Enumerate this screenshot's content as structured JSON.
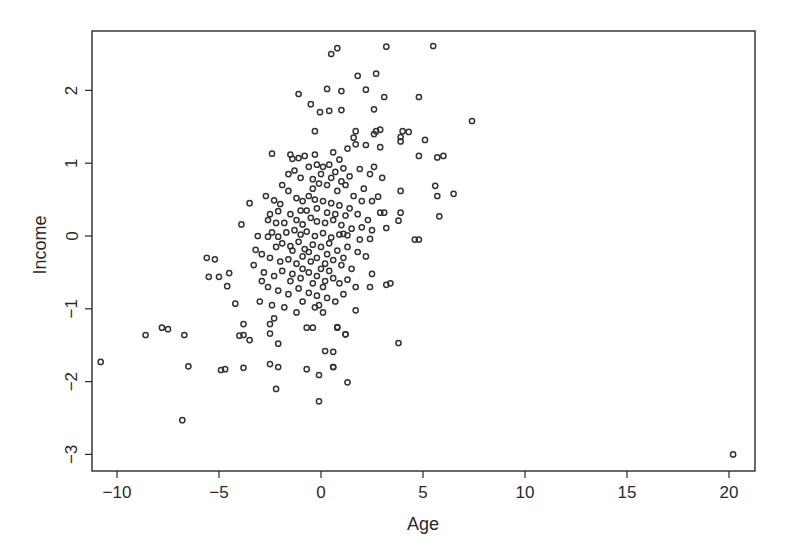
{
  "chart_data": {
    "type": "scatter",
    "title": "",
    "xlabel": "Age",
    "ylabel": "Income",
    "xlim": [
      -11.3,
      21.3
    ],
    "ylim": [
      -3.2,
      2.8
    ],
    "xticks": [
      -10,
      -5,
      0,
      5,
      10,
      15,
      20
    ],
    "yticks": [
      -3,
      -2,
      -1,
      0,
      1,
      2
    ],
    "xtick_labels": [
      "−10",
      "−5",
      "0",
      "5",
      "10",
      "15",
      "20"
    ],
    "ytick_labels": [
      "−3",
      "−2",
      "−1",
      "0",
      "1",
      "2"
    ],
    "grid": false,
    "legend": null,
    "marker": "open-circle",
    "marker_color": "#333333",
    "points": [
      [
        -10.8,
        -1.73
      ],
      [
        -8.6,
        -1.36
      ],
      [
        -7.8,
        -1.26
      ],
      [
        -7.5,
        -1.28
      ],
      [
        -6.7,
        -1.36
      ],
      [
        -6.5,
        -1.79
      ],
      [
        -6.8,
        -2.53
      ],
      [
        -5.6,
        -0.3
      ],
      [
        -5.2,
        -0.32
      ],
      [
        -5.5,
        -0.56
      ],
      [
        -5.0,
        -0.56
      ],
      [
        -4.5,
        -0.51
      ],
      [
        -4.6,
        -0.69
      ],
      [
        -4.2,
        -0.93
      ],
      [
        -4.0,
        -1.37
      ],
      [
        -4.9,
        -1.84
      ],
      [
        -4.7,
        -1.83
      ],
      [
        -3.8,
        -1.81
      ],
      [
        -3.2,
        -0.19
      ],
      [
        -3.5,
        -1.43
      ],
      [
        -3.9,
        0.16
      ],
      [
        -3.5,
        0.45
      ],
      [
        -2.4,
        1.13
      ],
      [
        -2.7,
        0.55
      ],
      [
        -2.3,
        0.49
      ],
      [
        -2.5,
        0.3
      ],
      [
        -2.1,
        0.34
      ],
      [
        -2.4,
        0.05
      ],
      [
        -2.6,
        -0.01
      ],
      [
        -2.1,
        -0.01
      ],
      [
        -3.8,
        -1.21
      ],
      [
        -3.8,
        -1.36
      ],
      [
        -2.5,
        -1.21
      ],
      [
        -2.3,
        -1.13
      ],
      [
        -2.5,
        -1.34
      ],
      [
        -2.1,
        -1.48
      ],
      [
        -2.5,
        -1.76
      ],
      [
        -2.1,
        -1.8
      ],
      [
        -2.2,
        -2.1
      ],
      [
        -0.7,
        -1.26
      ],
      [
        -0.4,
        -1.26
      ],
      [
        0.8,
        -1.26
      ],
      [
        1.2,
        -1.35
      ],
      [
        0.2,
        -1.58
      ],
      [
        0.6,
        -1.8
      ],
      [
        -0.7,
        -1.83
      ],
      [
        -0.1,
        -1.91
      ],
      [
        -0.1,
        -2.27
      ],
      [
        1.3,
        -2.01
      ],
      [
        0.6,
        -1.59
      ],
      [
        0.5,
        2.5
      ],
      [
        0.8,
        2.58
      ],
      [
        3.2,
        2.6
      ],
      [
        5.5,
        2.61
      ],
      [
        1.8,
        2.2
      ],
      [
        2.7,
        2.23
      ],
      [
        -1.1,
        1.95
      ],
      [
        -0.5,
        1.81
      ],
      [
        0.3,
        2.02
      ],
      [
        1.0,
        1.99
      ],
      [
        2.2,
        2.01
      ],
      [
        -0.05,
        1.7
      ],
      [
        0.4,
        1.72
      ],
      [
        1.0,
        1.73
      ],
      [
        2.6,
        1.74
      ],
      [
        3.1,
        1.91
      ],
      [
        4.8,
        1.91
      ],
      [
        7.4,
        1.58
      ],
      [
        -0.3,
        1.44
      ],
      [
        1.7,
        1.44
      ],
      [
        2.9,
        1.46
      ],
      [
        4.0,
        1.44
      ],
      [
        1.7,
        1.26
      ],
      [
        3.9,
        1.3
      ],
      [
        5.1,
        1.32
      ],
      [
        2.9,
        1.22
      ],
      [
        2.2,
        1.25
      ],
      [
        6.0,
        1.1
      ],
      [
        2.7,
        1.44
      ],
      [
        2.6,
        1.4
      ],
      [
        4.3,
        1.43
      ],
      [
        3.9,
        1.36
      ],
      [
        4.8,
        1.1
      ],
      [
        5.7,
        1.08
      ],
      [
        5.6,
        0.69
      ],
      [
        5.7,
        0.55
      ],
      [
        6.5,
        0.58
      ],
      [
        3.9,
        0.62
      ],
      [
        5.8,
        0.27
      ],
      [
        3.9,
        0.32
      ],
      [
        3.8,
        0.21
      ],
      [
        4.6,
        -0.05
      ],
      [
        4.8,
        -0.05
      ],
      [
        3.2,
        0.11
      ],
      [
        2.5,
        0.48
      ],
      [
        2.8,
        0.54
      ],
      [
        2.5,
        0.08
      ],
      [
        2.9,
        0.32
      ],
      [
        3.1,
        0.32
      ],
      [
        2.4,
        -0.04
      ],
      [
        1.1,
        0.03
      ],
      [
        1.3,
        0.01
      ],
      [
        2.5,
        -0.52
      ],
      [
        3.2,
        -0.67
      ],
      [
        3.4,
        -0.65
      ],
      [
        2.4,
        -0.7
      ],
      [
        1.7,
        -0.7
      ],
      [
        1.1,
        -0.8
      ],
      [
        1.7,
        -1.02
      ],
      [
        0.8,
        -1.25
      ],
      [
        1.2,
        -1.35
      ],
      [
        3.8,
        -1.47
      ],
      [
        0.6,
        -1.8
      ],
      [
        -1.5,
        1.12
      ],
      [
        -1.4,
        1.06
      ],
      [
        -1.1,
        1.07
      ],
      [
        -1.3,
        0.9
      ],
      [
        -1.0,
        0.8
      ],
      [
        -0.6,
        0.95
      ],
      [
        -0.2,
        0.98
      ],
      [
        0.1,
        0.95
      ],
      [
        0.4,
        0.98
      ],
      [
        0.7,
        0.88
      ],
      [
        1.1,
        0.93
      ],
      [
        1.4,
        0.82
      ],
      [
        -0.4,
        0.78
      ],
      [
        -0.1,
        0.72
      ],
      [
        0.3,
        0.7
      ],
      [
        0.8,
        0.62
      ],
      [
        1.2,
        0.7
      ],
      [
        1.6,
        0.55
      ],
      [
        2.0,
        0.48
      ],
      [
        -1.6,
        0.62
      ],
      [
        -1.2,
        0.52
      ],
      [
        -0.9,
        0.48
      ],
      [
        -0.6,
        0.55
      ],
      [
        -0.3,
        0.5
      ],
      [
        0.1,
        0.48
      ],
      [
        0.5,
        0.45
      ],
      [
        0.9,
        0.42
      ],
      [
        1.4,
        0.38
      ],
      [
        1.8,
        0.3
      ],
      [
        -2.0,
        0.44
      ],
      [
        -1.8,
        0.18
      ],
      [
        -1.5,
        0.3
      ],
      [
        -1.2,
        0.22
      ],
      [
        -0.9,
        0.16
      ],
      [
        -0.5,
        0.25
      ],
      [
        -0.2,
        0.2
      ],
      [
        0.2,
        0.18
      ],
      [
        0.6,
        0.22
      ],
      [
        1.0,
        0.15
      ],
      [
        1.5,
        0.1
      ],
      [
        2.0,
        0.12
      ],
      [
        -1.7,
        0.05
      ],
      [
        -1.3,
        0.08
      ],
      [
        -1.0,
        0.02
      ],
      [
        -0.7,
        0.06
      ],
      [
        -0.3,
        0.0
      ],
      [
        0.1,
        0.04
      ],
      [
        0.5,
        -0.02
      ],
      [
        0.9,
        0.02
      ],
      [
        -2.2,
        -0.15
      ],
      [
        -1.9,
        -0.1
      ],
      [
        -1.5,
        -0.14
      ],
      [
        -1.1,
        -0.08
      ],
      [
        -0.8,
        -0.18
      ],
      [
        -0.4,
        -0.12
      ],
      [
        0.0,
        -0.15
      ],
      [
        0.4,
        -0.1
      ],
      [
        0.8,
        -0.2
      ],
      [
        1.3,
        -0.15
      ],
      [
        1.8,
        -0.22
      ],
      [
        2.2,
        -0.28
      ],
      [
        -2.5,
        -0.3
      ],
      [
        -2.0,
        -0.35
      ],
      [
        -1.6,
        -0.32
      ],
      [
        -1.2,
        -0.38
      ],
      [
        -0.9,
        -0.28
      ],
      [
        -0.5,
        -0.35
      ],
      [
        -0.2,
        -0.3
      ],
      [
        0.2,
        -0.38
      ],
      [
        0.6,
        -0.33
      ],
      [
        1.0,
        -0.4
      ],
      [
        1.5,
        -0.45
      ],
      [
        -2.8,
        -0.5
      ],
      [
        -2.3,
        -0.55
      ],
      [
        -1.9,
        -0.48
      ],
      [
        -1.4,
        -0.52
      ],
      [
        -1.0,
        -0.58
      ],
      [
        -0.6,
        -0.5
      ],
      [
        -0.2,
        -0.55
      ],
      [
        0.2,
        -0.62
      ],
      [
        0.6,
        -0.58
      ],
      [
        0.9,
        -0.65
      ],
      [
        -2.6,
        -0.7
      ],
      [
        -2.1,
        -0.75
      ],
      [
        -1.6,
        -0.8
      ],
      [
        -1.1,
        -0.72
      ],
      [
        -0.6,
        -0.78
      ],
      [
        -0.2,
        -0.82
      ],
      [
        0.3,
        -0.85
      ],
      [
        -3.0,
        -0.9
      ],
      [
        -2.4,
        -0.95
      ],
      [
        -1.8,
        -0.98
      ],
      [
        -1.2,
        -1.05
      ],
      [
        -0.3,
        -0.98
      ],
      [
        0.1,
        -1.05
      ],
      [
        -2.9,
        -0.62
      ],
      [
        -3.3,
        -0.4
      ],
      [
        -2.9,
        -0.25
      ],
      [
        -3.1,
        0.0
      ],
      [
        -1.9,
        0.7
      ],
      [
        -1.6,
        0.85
      ],
      [
        -0.8,
        1.1
      ],
      [
        -0.3,
        1.12
      ],
      [
        0.6,
        1.15
      ],
      [
        1.3,
        1.2
      ],
      [
        0.9,
        1.05
      ],
      [
        -0.7,
        0.35
      ],
      [
        -0.2,
        0.38
      ],
      [
        0.3,
        0.32
      ],
      [
        0.7,
        0.3
      ],
      [
        1.2,
        0.28
      ],
      [
        -1.4,
        -0.2
      ],
      [
        -0.6,
        -0.22
      ],
      [
        0.3,
        -0.25
      ],
      [
        1.1,
        -0.3
      ],
      [
        -0.9,
        -0.45
      ],
      [
        0.0,
        -0.45
      ],
      [
        0.4,
        -0.48
      ],
      [
        -0.4,
        -0.65
      ],
      [
        0.1,
        -0.7
      ],
      [
        -0.1,
        -0.95
      ],
      [
        -0.9,
        -0.9
      ],
      [
        -1.5,
        -0.62
      ],
      [
        0.7,
        -0.9
      ],
      [
        1.3,
        -0.6
      ],
      [
        1.9,
        -0.05
      ],
      [
        2.3,
        0.22
      ],
      [
        2.1,
        0.65
      ],
      [
        2.4,
        0.85
      ],
      [
        1.9,
        0.92
      ],
      [
        2.6,
        0.95
      ],
      [
        3.0,
        0.8
      ],
      [
        1.6,
        1.35
      ],
      [
        -2.6,
        0.22
      ],
      [
        -2.2,
        0.18
      ],
      [
        -1.0,
        0.35
      ],
      [
        -0.4,
        0.65
      ],
      [
        0.0,
        0.85
      ],
      [
        0.5,
        0.8
      ],
      [
        1.0,
        0.75
      ],
      [
        20.2,
        -3.0
      ]
    ]
  }
}
